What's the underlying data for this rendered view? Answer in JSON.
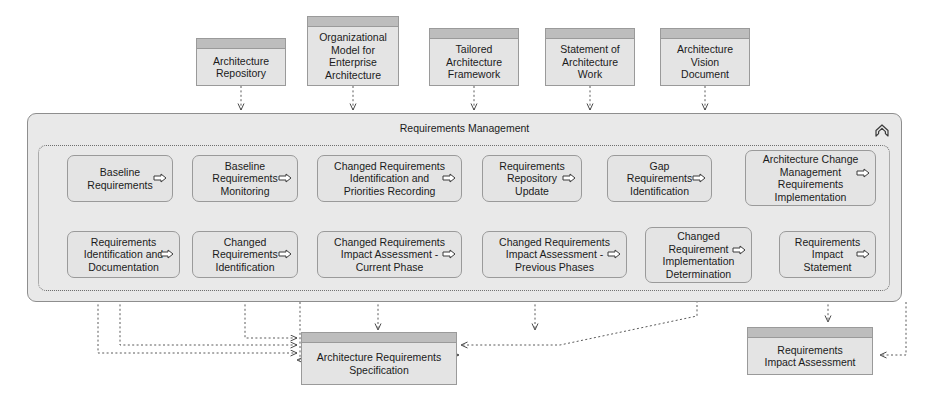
{
  "diagram": {
    "colors": {
      "box_fill": "#e4e4e4",
      "box_border": "#9a9a9a",
      "header_strip": "#bdbdbd",
      "group_fill": "#e9e9e9",
      "group_border": "#8e8e8e",
      "solid_edge": "#2b2b2b",
      "dotted_edge": "#6e6e6e",
      "text": "#1b1b1b"
    }
  },
  "artifacts_top": [
    {
      "id": "architecture-repository",
      "label": "Architecture\nRepository",
      "x": 196,
      "y": 38,
      "w": 90,
      "h": 48
    },
    {
      "id": "organizational-model",
      "label": "Organizational\nModel for\nEnterprise\nArchitecture",
      "x": 307,
      "y": 16,
      "w": 92,
      "h": 70
    },
    {
      "id": "tailored-architecture-framework",
      "label": "Tailored\nArchitecture\nFramework",
      "x": 429,
      "y": 28,
      "w": 90,
      "h": 58
    },
    {
      "id": "statement-of-architecture-work",
      "label": "Statement of\nArchitecture\nWork",
      "x": 545,
      "y": 28,
      "w": 90,
      "h": 58
    },
    {
      "id": "architecture-vision-document",
      "label": "Architecture\nVision\nDocument",
      "x": 660,
      "y": 28,
      "w": 90,
      "h": 58
    }
  ],
  "group": {
    "label": "Requirements Management",
    "icon": "process-chevron-up-icon",
    "x": 27,
    "y": 113,
    "w": 875,
    "h": 189,
    "inner": {
      "x": 38,
      "y": 145,
      "w": 852,
      "h": 146
    }
  },
  "process_row1": [
    {
      "id": "baseline-requirements",
      "label": "Baseline\nRequirements",
      "x": 67,
      "y": 155,
      "w": 106,
      "h": 47,
      "icon": "arrow-right-icon"
    },
    {
      "id": "baseline-requirements-monitoring",
      "label": "Baseline\nRequirements\nMonitoring",
      "x": 192,
      "y": 155,
      "w": 106,
      "h": 47,
      "icon": "arrow-right-icon"
    },
    {
      "id": "changed-requirements-identification-priorities",
      "label": "Changed Requirements\nIdentification and\nPriorities Recording",
      "x": 317,
      "y": 155,
      "w": 145,
      "h": 47,
      "icon": "arrow-right-icon"
    },
    {
      "id": "requirements-repository-update",
      "label": "Requirements\nRepository\nUpdate",
      "x": 482,
      "y": 155,
      "w": 100,
      "h": 47,
      "icon": "arrow-right-icon"
    },
    {
      "id": "gap-requirements-identification",
      "label": "Gap\nRequirements\nIdentification",
      "x": 607,
      "y": 155,
      "w": 105,
      "h": 47,
      "icon": "arrow-right-icon"
    },
    {
      "id": "architecture-change-management-requirements-implementation",
      "label": "Architecture Change\nManagement\nRequirements\nImplementation",
      "x": 745,
      "y": 150,
      "w": 131,
      "h": 56,
      "icon": "arrow-right-icon"
    }
  ],
  "process_row2": [
    {
      "id": "requirements-identification-documentation",
      "label": "Requirements\nIdentification and\nDocumentation",
      "x": 67,
      "y": 231,
      "w": 113,
      "h": 47,
      "icon": "arrow-right-icon"
    },
    {
      "id": "changed-requirements-identification",
      "label": "Changed\nRequirements\nIdentification",
      "x": 192,
      "y": 231,
      "w": 106,
      "h": 47,
      "icon": "arrow-right-icon"
    },
    {
      "id": "changed-requirements-impact-assessment-current-phase",
      "label": "Changed Requirements\nImpact Assessment -\nCurrent Phase",
      "x": 317,
      "y": 231,
      "w": 145,
      "h": 47,
      "icon": "arrow-right-icon"
    },
    {
      "id": "changed-requirements-impact-assessment-previous-phases",
      "label": "Changed Requirements\nImpact Assessment -\nPrevious Phases",
      "x": 482,
      "y": 231,
      "w": 145,
      "h": 47,
      "icon": "arrow-right-icon"
    },
    {
      "id": "changed-requirement-implementation-determination",
      "label": "Changed\nRequirement\nImplementation\nDetermination",
      "x": 645,
      "y": 227,
      "w": 107,
      "h": 56,
      "icon": "arrow-right-icon"
    },
    {
      "id": "requirements-impact-statement",
      "label": "Requirements\nImpact\nStatement",
      "x": 779,
      "y": 231,
      "w": 97,
      "h": 47,
      "icon": "arrow-right-icon"
    }
  ],
  "artifacts_bottom": [
    {
      "id": "architecture-requirements-specification",
      "label": "Architecture Requirements\nSpecification",
      "x": 301,
      "y": 332,
      "w": 156,
      "h": 53
    },
    {
      "id": "requirements-impact-assessment",
      "label": "Requirements\nImpact Assessment",
      "x": 747,
      "y": 327,
      "w": 126,
      "h": 48
    }
  ]
}
